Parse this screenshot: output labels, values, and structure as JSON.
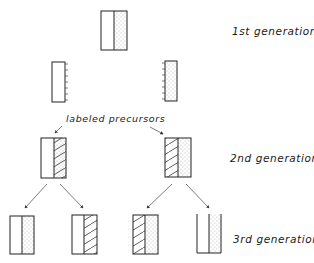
{
  "labels": {
    "gen1": "1st generation",
    "gen2": "2nd generation",
    "gen3": "3rd generation",
    "precursors": "labeled precursors"
  },
  "legend_patterns": {
    "blank": "unlabeled parental strand",
    "dots": "dotted strand",
    "hatch": "hatched (labeled) strand"
  },
  "generations": [
    {
      "name": "1st generation",
      "molecules": [
        {
          "left": "blank",
          "right": "dots"
        }
      ]
    },
    {
      "name": "separated strands",
      "molecules": [
        {
          "strand": "blank",
          "ticks": "right"
        },
        {
          "strand": "dots",
          "ticks": "left"
        }
      ]
    },
    {
      "name": "2nd generation",
      "molecules": [
        {
          "left": "blank",
          "right": "hatch+dots"
        },
        {
          "left": "hatch",
          "right": "dots"
        }
      ]
    },
    {
      "name": "3rd generation",
      "molecules": [
        {
          "left": "blank",
          "right": "dots"
        },
        {
          "left": "blank",
          "right": "hatch"
        },
        {
          "left": "hatch",
          "right": "dots"
        },
        {
          "left": "blank",
          "right": "dots",
          "open_top": true
        }
      ]
    }
  ]
}
